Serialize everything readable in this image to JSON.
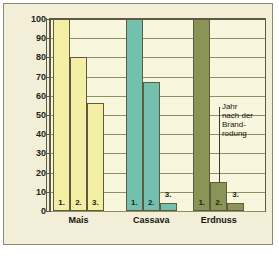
{
  "chart_data": {
    "type": "bar",
    "title": "",
    "subtitle": "",
    "xlabel": "",
    "ylabel": "",
    "ylim": [
      0,
      100
    ],
    "yticks": [
      0,
      10,
      20,
      30,
      40,
      50,
      60,
      70,
      80,
      90,
      100
    ],
    "grid": true,
    "legend": "none",
    "categories": [
      "Mais",
      "Cassava",
      "Erdnuss"
    ],
    "series": [
      {
        "name": "1.",
        "values": [
          100,
          100,
          100
        ]
      },
      {
        "name": "2.",
        "values": [
          80,
          67,
          15
        ]
      },
      {
        "name": "3.",
        "values": [
          56,
          4,
          4
        ]
      }
    ],
    "bar_value_labels": [
      [
        "1.",
        "2.",
        "3."
      ],
      [
        "1.",
        "2.",
        "3."
      ],
      [
        "1.",
        "2.",
        "3."
      ]
    ],
    "annotations": [
      {
        "text": "Jahr\nnach der\nBrand-\nrodung",
        "points_to": "Erdnuss series 2"
      }
    ],
    "colors": {
      "mais": "#f4efa4",
      "cassava": "#74c0af",
      "erdnuss": "#8b9457",
      "plot_background": "#f8f6dd",
      "plate_background": "#f2eed8",
      "gridline": "#8f8f63",
      "axis": "#5d5c43",
      "text": "#14140f"
    }
  },
  "caption": {
    "text": ""
  }
}
